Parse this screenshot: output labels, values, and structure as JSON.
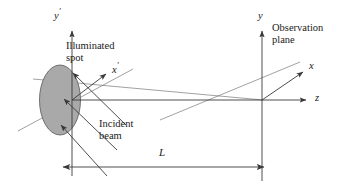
{
  "figure": {
    "background_color": "#ffffff",
    "line_color": "#3a3a3a",
    "spot_fill_color": "#a9a9a9",
    "spot_stroke_color": "#4a4a4a",
    "text_color": "#1a1a1a",
    "width": 340,
    "height": 182
  },
  "axes": [
    {
      "name": "y-prime-axis",
      "label": "y",
      "prime": "′",
      "orientation": "vertical-up",
      "origin": [
        72,
        100
      ],
      "tip": [
        72,
        30
      ],
      "label_pos": [
        55,
        8
      ]
    },
    {
      "name": "x-prime-axis",
      "label": "x",
      "prime": "′",
      "orientation": "diagonal-up-right",
      "origin": [
        72,
        100
      ],
      "tip": [
        108,
        73
      ],
      "label_pos": [
        113,
        62
      ]
    },
    {
      "name": "y-axis",
      "label": "y",
      "prime": "",
      "orientation": "vertical-up",
      "origin": [
        262,
        100
      ],
      "tip": [
        262,
        30
      ],
      "label_pos": [
        258,
        12
      ]
    },
    {
      "name": "x-axis",
      "label": "x",
      "prime": "",
      "orientation": "diagonal-up-right",
      "origin": [
        262,
        100
      ],
      "tip": [
        305,
        71
      ],
      "label_pos": [
        310,
        61
      ]
    },
    {
      "name": "z-axis",
      "label": "z",
      "prime": "",
      "orientation": "horizontal-right",
      "origin": [
        72,
        100
      ],
      "tip": [
        310,
        100
      ],
      "label_pos": [
        316,
        93
      ]
    }
  ],
  "labels": {
    "illuminated_spot": {
      "line1": "Illuminated",
      "line2": "spot",
      "pos": [
        66,
        40
      ]
    },
    "incident_beam": {
      "line1": "Incident",
      "line2": "beam",
      "pos": [
        99,
        117
      ]
    },
    "observation_plane": {
      "line1": "Observation",
      "line2": "plane",
      "pos": [
        272,
        22
      ]
    },
    "distance": {
      "text": "L",
      "pos": [
        159,
        145
      ]
    }
  },
  "spot": {
    "name": "illuminated-spot",
    "shape": "ellipse",
    "center": [
      60,
      100
    ],
    "rx": 20,
    "ry": 35,
    "fill": "#a9a9a9"
  },
  "incident_beams": [
    {
      "from": [
        128,
        126
      ],
      "to": [
        72,
        72
      ]
    },
    {
      "from": [
        118,
        152
      ],
      "to": [
        63,
        99
      ]
    },
    {
      "from": [
        108,
        178
      ],
      "to": [
        60,
        126
      ]
    }
  ],
  "observation_plane_line": {
    "name": "observation-plane-line",
    "from": [
      262,
      30
    ],
    "to": [
      262,
      180
    ]
  },
  "dimension": {
    "name": "distance-dimension-L",
    "y": 167,
    "x_start": 62,
    "x_end": 265,
    "symbol": "L",
    "arrows": "both"
  },
  "extension_lines": [
    {
      "from": [
        72,
        100
      ],
      "to": [
        72,
        176
      ]
    },
    {
      "from": [
        262,
        100
      ],
      "to": [
        262,
        180
      ]
    }
  ],
  "scatter_rays": [
    {
      "from": [
        72,
        100
      ],
      "to": [
        310,
        100
      ]
    },
    {
      "from": [
        20,
        128
      ],
      "to": [
        130,
        70
      ]
    },
    {
      "from": [
        34,
        80
      ],
      "to": [
        262,
        100
      ]
    }
  ]
}
